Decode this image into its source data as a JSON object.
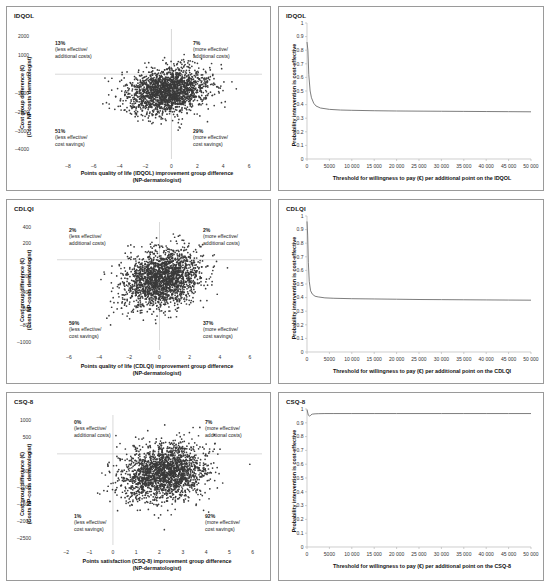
{
  "figure": {
    "panels": [
      {
        "id": "idqol-ce-plane",
        "title": "IDQOL",
        "xlabel_line1": "Points quality of life (IDQOL) improvement group difference",
        "xlabel_line2": "(NP-dermatologist)",
        "ylabel_line1": "Cost group difference (€)",
        "ylabel_line2": "(Costs NP-costs dermatologist)",
        "xticks": [
          -8,
          -6,
          -4,
          -2,
          0,
          2,
          4,
          6
        ],
        "yticks": [
          2000,
          1000,
          0,
          -1000,
          -2000,
          -3000,
          -4000
        ],
        "quadrants": [
          {
            "pct": "13%",
            "l1": "(less effective/",
            "l2": "additional costs)",
            "pos": "top-left"
          },
          {
            "pct": "7%",
            "l1": "(more effective/",
            "l2": "additional costs)",
            "pos": "top-right"
          },
          {
            "pct": "51%",
            "l1": "(less effective/",
            "l2": "cost savings)",
            "pos": "bottom-left"
          },
          {
            "pct": "29%",
            "l1": "(more effective/",
            "l2": "cost savings)",
            "pos": "bottom-right"
          }
        ]
      },
      {
        "id": "idqol-ceac",
        "title": "IDQOL",
        "xlabel_line1": "Threshold for willingness to pay (€) per additional point on the IDQOL",
        "ylabel_line1": "Probability intervention is cost-effective",
        "xticks": [
          "0",
          "5000",
          "10 000",
          "15 000",
          "20 000",
          "25 000",
          "30 000",
          "35 000",
          "40 000",
          "45 000",
          "50 000"
        ],
        "yticks": [
          "1",
          "0.9",
          "0.8",
          "0.7",
          "0.6",
          "0.5",
          "0.4",
          "0.3",
          "0.2",
          "0.1",
          "0"
        ]
      },
      {
        "id": "cdlqi-ce-plane",
        "title": "CDLQI",
        "xlabel_line1": "Points quality of life (CDLQI) improvement group difference",
        "xlabel_line2": "(NP-dermatologist)",
        "ylabel_line1": "Cost group difference (€)",
        "ylabel_line2": "(Costs NP-costs dermatologist)",
        "xticks": [
          -6,
          -4,
          -2,
          0,
          2,
          4,
          6
        ],
        "yticks": [
          400,
          200,
          0,
          -200,
          -400,
          -600,
          -800,
          -1000
        ],
        "quadrants": [
          {
            "pct": "2%",
            "l1": "(less effective/",
            "l2": "additional costs)",
            "pos": "top-left"
          },
          {
            "pct": "2%",
            "l1": "(more effective/",
            "l2": "additional costs)",
            "pos": "top-right"
          },
          {
            "pct": "59%",
            "l1": "(less effective/",
            "l2": "cost savings)",
            "pos": "bottom-left"
          },
          {
            "pct": "37%",
            "l1": "(more effective/",
            "l2": "cost savings)",
            "pos": "bottom-right"
          }
        ]
      },
      {
        "id": "cdlqi-ceac",
        "title": "CDLQI",
        "xlabel_line1": "Threshold for willingness to pay (€) per additional point on the CDLQI",
        "ylabel_line1": "Probability intervention is cost-effective",
        "xticks": [
          "0",
          "5000",
          "10 000",
          "15 000",
          "20 000",
          "25 000",
          "30 000",
          "35 000",
          "40 000",
          "45 000",
          "50 000"
        ],
        "yticks": [
          "1",
          "0.9",
          "0.8",
          "0.7",
          "0.6",
          "0.5",
          "0.4",
          "0.3",
          "0.2",
          "0.1",
          "0"
        ]
      },
      {
        "id": "csq8-ce-plane",
        "title": "CSQ-8",
        "xlabel_line1": "Points satisfaction (CSQ-8) improvement group difference",
        "xlabel_line2": "(NP-dermatologist)",
        "ylabel_line1": "Cost group difference (€)",
        "ylabel_line2": "(Costs NP-costs dermatologist)",
        "xticks": [
          -2,
          -1,
          0,
          1,
          2,
          3,
          4,
          5,
          6
        ],
        "yticks": [
          1000,
          500,
          0,
          -500,
          -1000,
          -1500,
          -2000,
          -2500
        ],
        "quadrants": [
          {
            "pct": "0%",
            "l1": "(less effective/",
            "l2": "additional costs)",
            "pos": "top-left"
          },
          {
            "pct": "7%",
            "l1": "(more effective/",
            "l2": "additional costs)",
            "pos": "top-right"
          },
          {
            "pct": "1%",
            "l1": "(less effective/",
            "l2": "cost savings)",
            "pos": "bottom-left"
          },
          {
            "pct": "92%",
            "l1": "(more effective/",
            "l2": "cost savings)",
            "pos": "bottom-right"
          }
        ]
      },
      {
        "id": "csq8-ceac",
        "title": "CSQ-8",
        "xlabel_line1": "Threshold for willingness to pay (€) per additional point on the CSQ-8",
        "ylabel_line1": "Probability intervention is cost-effective",
        "xticks": [
          "0",
          "5000",
          "10 000",
          "15 000",
          "20 000",
          "25 000",
          "30 000",
          "35 000",
          "40 000",
          "45 000",
          "50 000"
        ],
        "yticks": [
          "1",
          "0.9",
          "0.8",
          "0.7",
          "0.6",
          "0.5",
          "0.4",
          "0.3",
          "0.2",
          "0.1",
          "0"
        ]
      }
    ]
  },
  "chart_data": [
    {
      "type": "scatter",
      "title": "IDQOL",
      "xlabel": "Points quality of life (IDQOL) improvement group difference (NP-dermatologist)",
      "ylabel": "Cost group difference (€) (Costs NP-costs dermatologist)",
      "xlim": [
        -9,
        7
      ],
      "ylim": [
        -4500,
        2400
      ],
      "xticks": [
        -8,
        -6,
        -4,
        -2,
        0,
        2,
        4,
        6
      ],
      "yticks": [
        2000,
        1000,
        0,
        -1000,
        -2000,
        -3000,
        -4000
      ],
      "grid": false,
      "n_points": 2000,
      "cloud_center": [
        -0.35,
        -900
      ],
      "cloud_sd": [
        1.55,
        620
      ],
      "quadrant_percentages": {
        "northwest_less_effective_additional_costs": 13,
        "northeast_more_effective_additional_costs": 7,
        "southwest_less_effective_cost_savings": 51,
        "southeast_more_effective_cost_savings": 29
      }
    },
    {
      "type": "line",
      "title": "IDQOL",
      "xlabel": "Threshold for willingness to pay (€) per additional point on the IDQOL",
      "ylabel": "Probability intervention is cost-effective",
      "xlim": [
        0,
        50000
      ],
      "ylim": [
        0,
        1
      ],
      "grid": false,
      "legend": "none",
      "x": [
        0,
        200,
        400,
        700,
        1000,
        1500,
        2000,
        3000,
        5000,
        7500,
        10000,
        15000,
        20000,
        25000,
        30000,
        35000,
        40000,
        45000,
        50000
      ],
      "y": [
        0.86,
        0.8,
        0.62,
        0.5,
        0.45,
        0.41,
        0.39,
        0.375,
        0.365,
        0.36,
        0.358,
        0.355,
        0.353,
        0.352,
        0.351,
        0.35,
        0.349,
        0.348,
        0.347
      ]
    },
    {
      "type": "scatter",
      "title": "CDLQI",
      "xlabel": "Points quality of life (CDLQI) improvement group difference (NP-dermatologist)",
      "ylabel": "Cost group difference (€) (Costs NP-costs dermatologist)",
      "xlim": [
        -6.8,
        6.8
      ],
      "ylim": [
        -1100,
        460
      ],
      "xticks": [
        -6,
        -4,
        -2,
        0,
        2,
        4,
        6
      ],
      "yticks": [
        400,
        200,
        0,
        -200,
        -400,
        -600,
        -800,
        -1000
      ],
      "grid": false,
      "n_points": 2000,
      "cloud_center": [
        0.15,
        -230
      ],
      "cloud_sd": [
        1.25,
        175
      ],
      "quadrant_percentages": {
        "northwest_less_effective_additional_costs": 2,
        "northeast_more_effective_additional_costs": 2,
        "southwest_less_effective_cost_savings": 59,
        "southeast_more_effective_cost_savings": 37
      }
    },
    {
      "type": "line",
      "title": "CDLQI",
      "xlabel": "Threshold for willingness to pay (€) per additional point on the CDLQI",
      "ylabel": "Probability intervention is cost-effective",
      "xlim": [
        0,
        50000
      ],
      "ylim": [
        0,
        1
      ],
      "grid": false,
      "legend": "none",
      "x": [
        0,
        150,
        300,
        500,
        800,
        1200,
        1800,
        2500,
        4000,
        6000,
        10000,
        15000,
        20000,
        25000,
        30000,
        35000,
        40000,
        45000,
        50000
      ],
      "y": [
        0.96,
        0.86,
        0.66,
        0.52,
        0.45,
        0.425,
        0.41,
        0.405,
        0.398,
        0.395,
        0.392,
        0.39,
        0.388,
        0.386,
        0.385,
        0.384,
        0.383,
        0.382,
        0.381
      ]
    },
    {
      "type": "scatter",
      "title": "CSQ-8",
      "xlabel": "Points satisfaction (CSQ-8) improvement group difference (NP-dermatologist)",
      "ylabel": "Cost group difference (€) (Costs NP-costs dermatologist)",
      "xlim": [
        -2.4,
        6.4
      ],
      "ylim": [
        -2700,
        1150
      ],
      "xticks": [
        -2,
        -1,
        0,
        1,
        2,
        3,
        4,
        5,
        6
      ],
      "yticks": [
        1000,
        500,
        0,
        -500,
        -1000,
        -1500,
        -2000,
        -2500
      ],
      "grid": false,
      "n_points": 2000,
      "cloud_center": [
        2.15,
        -560
      ],
      "cloud_sd": [
        0.92,
        420
      ],
      "quadrant_percentages": {
        "northwest_less_effective_additional_costs": 0,
        "northeast_more_effective_additional_costs": 7,
        "southwest_less_effective_cost_savings": 1,
        "southeast_more_effective_cost_savings": 92
      }
    },
    {
      "type": "line",
      "title": "CSQ-8",
      "xlabel": "Threshold for willingness to pay (€) per additional point on the CSQ-8",
      "ylabel": "Probability intervention is cost-effective",
      "xlim": [
        0,
        50000
      ],
      "ylim": [
        0,
        1
      ],
      "grid": false,
      "legend": "none",
      "x": [
        0,
        300,
        600,
        900,
        1200,
        1800,
        2500,
        4000,
        6000,
        10000,
        15000,
        20000,
        25000,
        30000,
        35000,
        40000,
        45000,
        50000
      ],
      "y": [
        0.995,
        0.955,
        0.948,
        0.958,
        0.963,
        0.965,
        0.966,
        0.967,
        0.967,
        0.967,
        0.967,
        0.967,
        0.967,
        0.967,
        0.967,
        0.967,
        0.967,
        0.967
      ]
    }
  ]
}
